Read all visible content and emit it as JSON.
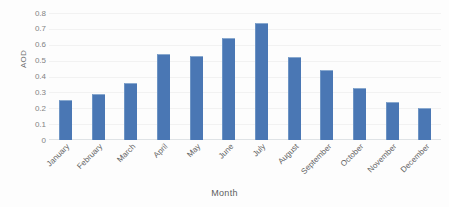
{
  "chart_data": {
    "type": "bar",
    "title": "",
    "subtitle": "",
    "xlabel": "Month",
    "ylabel": "AOD",
    "categories": [
      "January",
      "February",
      "March",
      "April",
      "May",
      "June",
      "July",
      "August",
      "September",
      "October",
      "November",
      "December"
    ],
    "values": [
      0.25,
      0.29,
      0.36,
      0.54,
      0.53,
      0.64,
      0.74,
      0.52,
      0.44,
      0.33,
      0.24,
      0.2
    ],
    "series": [
      {
        "name": "AOD",
        "values": [
          0.25,
          0.29,
          0.36,
          0.54,
          0.53,
          0.64,
          0.74,
          0.52,
          0.44,
          0.33,
          0.24,
          0.2
        ]
      }
    ],
    "ylim": [
      0,
      0.8
    ],
    "ytick_labels": [
      "0.8",
      "0.7",
      "0.6",
      "0.5",
      "0.4",
      "0.3",
      "0.2",
      "0.1",
      "0"
    ],
    "ytick_values": [
      0.8,
      0.7,
      0.6,
      0.5,
      0.4,
      0.3,
      0.2,
      0.1,
      0
    ],
    "ytick_step": 0.1,
    "grid": true,
    "grid_axis": "y",
    "legend": false,
    "legend_position": "none",
    "bar_color": "#4a77b4",
    "gridline_color": "#f2f2f2",
    "axis_color": "#dfe3e6",
    "annotations": []
  }
}
